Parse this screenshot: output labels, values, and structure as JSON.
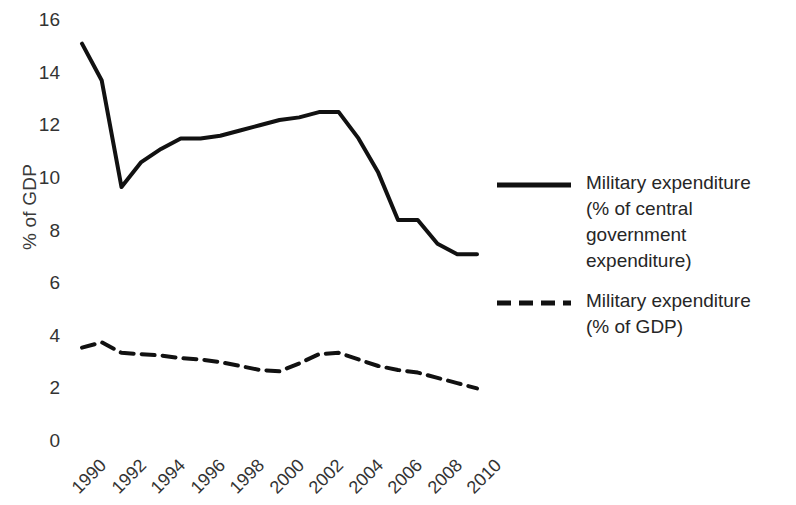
{
  "chart_data": {
    "type": "line",
    "title": "",
    "subtitle": "",
    "xlabel": "",
    "ylabel": "% of GDP",
    "xlim": [
      1990,
      2010
    ],
    "ylim": [
      0,
      16
    ],
    "ytick_step": 2,
    "grid": false,
    "legend_position": "right",
    "x": [
      1990,
      1991,
      1992,
      1993,
      1994,
      1995,
      1996,
      1997,
      1998,
      1999,
      2000,
      2001,
      2002,
      2003,
      2004,
      2005,
      2006,
      2007,
      2008,
      2009,
      2010
    ],
    "xticklabels": [
      "1990",
      "1992",
      "1994",
      "1996",
      "1998",
      "2000",
      "2002",
      "2004",
      "2006",
      "2008",
      "2010"
    ],
    "yticklabels": [
      "0",
      "2",
      "4",
      "6",
      "8",
      "10",
      "12",
      "14",
      "16"
    ],
    "series": [
      {
        "name": "Military expenditure\n(% of central government\nexpenditure)",
        "style": "solid",
        "color": "#111111",
        "values": [
          15.1,
          13.7,
          9.65,
          10.6,
          11.1,
          11.5,
          11.5,
          11.6,
          11.8,
          12.0,
          12.2,
          12.3,
          12.5,
          12.5,
          11.5,
          10.2,
          8.4,
          8.4,
          7.5,
          7.1,
          7.1
        ]
      },
      {
        "name": "Military expenditure\n(% of GDP)",
        "style": "dashed",
        "color": "#111111",
        "values": [
          3.55,
          3.75,
          3.35,
          3.3,
          3.25,
          3.15,
          3.1,
          3.0,
          2.85,
          2.7,
          2.65,
          2.95,
          3.3,
          3.35,
          3.1,
          2.85,
          2.7,
          2.6,
          2.4,
          2.2,
          2.0
        ]
      }
    ]
  },
  "yaxis": {
    "title": "% of GDP",
    "ticks": [
      {
        "label": "16",
        "value": 16
      },
      {
        "label": "14",
        "value": 14
      },
      {
        "label": "12",
        "value": 12
      },
      {
        "label": "10",
        "value": 10
      },
      {
        "label": "8",
        "value": 8
      },
      {
        "label": "6",
        "value": 6
      },
      {
        "label": "4",
        "value": 4
      },
      {
        "label": "2",
        "value": 2
      },
      {
        "label": "0",
        "value": 0
      }
    ]
  },
  "xaxis": {
    "ticks": [
      {
        "label": "1990",
        "value": 1990
      },
      {
        "label": "1992",
        "value": 1992
      },
      {
        "label": "1994",
        "value": 1994
      },
      {
        "label": "1996",
        "value": 1996
      },
      {
        "label": "1998",
        "value": 1998
      },
      {
        "label": "2000",
        "value": 2000
      },
      {
        "label": "2002",
        "value": 2002
      },
      {
        "label": "2004",
        "value": 2004
      },
      {
        "label": "2006",
        "value": 2006
      },
      {
        "label": "2008",
        "value": 2008
      },
      {
        "label": "2010",
        "value": 2010
      }
    ]
  },
  "legend": {
    "entries": [
      {
        "label": "Military expenditure\n(% of central government\nexpenditure)",
        "style": "solid"
      },
      {
        "label": "Military expenditure\n(% of GDP)",
        "style": "dashed"
      }
    ]
  }
}
